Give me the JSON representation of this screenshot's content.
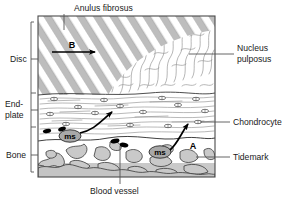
{
  "figure": {
    "title_alt": "Intervertebral disc end-plate and bone nutrition diagram",
    "frame": {
      "x": 38,
      "y": 16,
      "w": 177,
      "h": 161
    }
  },
  "labels": {
    "top": {
      "text": "Anulus fibrosus",
      "x": 74,
      "y": 11
    },
    "bottom": {
      "text": "Blood vessel",
      "x": 112,
      "y": 192
    },
    "left": [
      {
        "name": "disc",
        "text": "Disc",
        "x": 10,
        "y": 62
      },
      {
        "name": "endplate",
        "text_line1": "End-",
        "text_line2": "plate",
        "x": 5,
        "y": 110
      },
      {
        "name": "bone",
        "text": "Bone",
        "x": 6,
        "y": 155
      }
    ],
    "right": [
      {
        "name": "nucleus-pulposus",
        "text_line1": "Nucleus",
        "text_line2": "pulposus",
        "x": 237,
        "y": 52
      },
      {
        "name": "chondrocyte",
        "text": "Chondrocyte",
        "x": 233,
        "y": 125
      },
      {
        "name": "tidemark",
        "text": "Tidemark",
        "x": 233,
        "y": 160
      }
    ]
  },
  "annotations": {
    "arrow_b": {
      "label": "B",
      "x": 72,
      "y": 45
    },
    "arrow_a": {
      "label": "A",
      "x": 192,
      "y": 148
    },
    "marrow_spaces": [
      {
        "label": "ms",
        "x": 70,
        "y": 136
      },
      {
        "label": "ms",
        "x": 160,
        "y": 152
      }
    ]
  },
  "colors": {
    "ink": "#1a1a1a",
    "line": "#555555",
    "bone_fill": "#c9c9c9",
    "annulus_stripe": "#b8b8b8",
    "ms_fill": "#a8a8a8",
    "vessel_fill": "#000000",
    "background": "#ffffff"
  },
  "regions": [
    {
      "name": "anulus-fibrosus",
      "description": "diagonal lamellae stripes"
    },
    {
      "name": "nucleus-pulposus",
      "description": "wavy random fibres"
    },
    {
      "name": "end-plate",
      "description": "horizontal lamellae with chondrocyte ellipses"
    },
    {
      "name": "bone",
      "description": "grey trabecular mesh"
    }
  ]
}
